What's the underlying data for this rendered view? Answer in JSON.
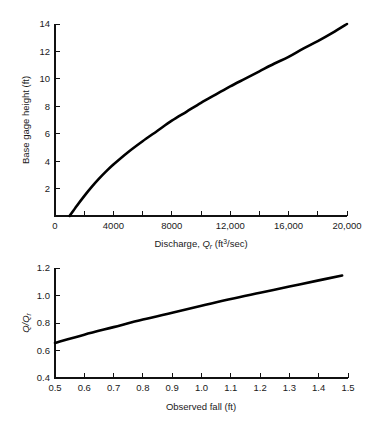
{
  "figure": {
    "background": "#ffffff",
    "line_color": "#000000",
    "axis_color": "#111111"
  },
  "chart_data": [
    {
      "id": "rating-curve",
      "type": "line",
      "title": "",
      "xlabel": "Discharge, Qr (ft3/sec)",
      "xlabel_parts": {
        "lead": "Discharge, ",
        "symbol": "Q",
        "symbol_sub": "r",
        "unit_open": " (ft",
        "unit_sup": "3",
        "unit_close": "/sec)"
      },
      "ylabel": "Base gage height (ft)",
      "xlim": [
        0,
        20000
      ],
      "ylim": [
        0,
        14
      ],
      "xticks": [
        0,
        2000,
        4000,
        6000,
        8000,
        10000,
        12000,
        14000,
        16000,
        18000,
        20000
      ],
      "xticklabels": [
        "0",
        "",
        "4000",
        "",
        "8000",
        "",
        "12,000",
        "",
        "16,000",
        "",
        "20,000"
      ],
      "yticks": [
        0,
        2,
        4,
        6,
        8,
        10,
        12,
        14
      ],
      "yticklabels": [
        "",
        "2",
        "4",
        "6",
        "8",
        "10",
        "12",
        "14"
      ],
      "grid": false,
      "legend": "none",
      "series": [
        {
          "name": "base rating",
          "x": [
            1000,
            1500,
            2000,
            2500,
            3000,
            3500,
            4000,
            5000,
            6000,
            7000,
            8000,
            9000,
            10000,
            11000,
            12000,
            13000,
            14000,
            15000,
            16000,
            17000,
            18000,
            19000,
            20000
          ],
          "y": [
            0.0,
            0.75,
            1.45,
            2.1,
            2.7,
            3.25,
            3.75,
            4.65,
            5.45,
            6.2,
            6.95,
            7.6,
            8.25,
            8.85,
            9.45,
            10.0,
            10.55,
            11.1,
            11.6,
            12.2,
            12.75,
            13.35,
            14.0
          ]
        }
      ]
    },
    {
      "id": "fall-ratio",
      "type": "line",
      "title": "",
      "xlabel": "Observed fall (ft)",
      "ylabel": "Q/Qr",
      "ylabel_parts": {
        "num": "Q",
        "slash": "/",
        "den": "Q",
        "den_sub": "r"
      },
      "xlim": [
        0.5,
        1.5
      ],
      "ylim": [
        0.4,
        1.2
      ],
      "xticks": [
        0.5,
        0.6,
        0.7,
        0.8,
        0.9,
        1.0,
        1.1,
        1.2,
        1.3,
        1.4,
        1.5
      ],
      "xticklabels": [
        "0.5",
        "0.6",
        "0.7",
        "0.8",
        "0.9",
        "1.0",
        "1.1",
        "1.2",
        "1.3",
        "1.4",
        "1.5"
      ],
      "yticks": [
        0.4,
        0.6,
        0.8,
        1.0,
        1.2
      ],
      "yticklabels": [
        "0.4",
        "0.6",
        "0.8",
        "1.0",
        "1.2"
      ],
      "grid": false,
      "legend": "none",
      "series": [
        {
          "name": "fall ratio",
          "x": [
            0.5,
            0.6,
            0.7,
            0.8,
            0.9,
            1.0,
            1.1,
            1.2,
            1.3,
            1.4,
            1.48
          ],
          "y": [
            0.655,
            0.715,
            0.77,
            0.825,
            0.875,
            0.925,
            0.975,
            1.02,
            1.065,
            1.11,
            1.145
          ]
        }
      ]
    }
  ]
}
